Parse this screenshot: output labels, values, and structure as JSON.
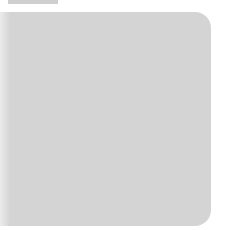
{
  "board": {
    "type": "go-board-diagram",
    "background_color": "#d4d4d4",
    "line_color": "#3a3a3a",
    "vertical_lines_x": [
      40,
      62,
      84,
      106,
      128,
      150,
      172,
      193
    ],
    "horizontal_lines_y": [
      35,
      58,
      80,
      102,
      125,
      147,
      168,
      190
    ],
    "left_edge_x": 17,
    "bottom_edge_y": 213,
    "stones": [
      {
        "color": "black",
        "cx": 62,
        "cy": 147,
        "r": 11
      },
      {
        "color": "white",
        "cx": 106,
        "cy": 168,
        "r": 10
      }
    ],
    "markers": [
      {
        "type": "dot",
        "color": "black",
        "cx": 84,
        "cy": 147,
        "r": 3.5
      }
    ]
  }
}
